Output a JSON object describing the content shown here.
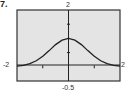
{
  "problem": {
    "number": "7."
  },
  "colors": {
    "frame_fill": "#e4e4e4",
    "frame_stroke": "#333333",
    "axis": "#222222",
    "curve": "#222222"
  },
  "chart_data": {
    "type": "line",
    "title": "",
    "xlabel": "",
    "ylabel": "",
    "xlim": [
      -2,
      2
    ],
    "ylim": [
      -0.5,
      2
    ],
    "grid": false,
    "legend": null,
    "window_labels": {
      "xmin": "-2",
      "xmax": "2",
      "ymax": "2",
      "ymin": "-0.5"
    },
    "x_ticks": [
      -1,
      0,
      1
    ],
    "y_ticks": [
      0.5,
      1,
      1.5
    ],
    "series": [
      {
        "name": "curve",
        "x": [
          -2,
          -1.75,
          -1.5,
          -1.25,
          -1,
          -0.75,
          -0.5,
          -0.25,
          0,
          0.25,
          0.5,
          0.75,
          1,
          1.25,
          1.5,
          1.75,
          2
        ],
        "y": [
          0.02,
          0.05,
          0.11,
          0.21,
          0.37,
          0.57,
          0.78,
          0.94,
          1.0,
          0.94,
          0.78,
          0.57,
          0.37,
          0.21,
          0.11,
          0.05,
          0.02
        ]
      }
    ]
  }
}
